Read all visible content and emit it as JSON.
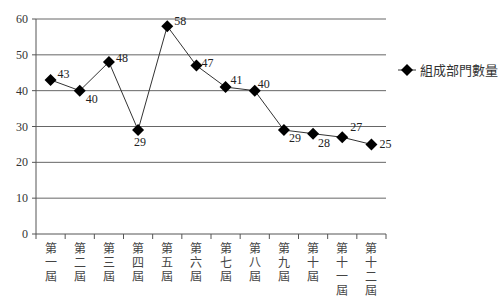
{
  "chart_data": {
    "type": "line",
    "title": "",
    "xlabel": "",
    "ylabel": "",
    "categories": [
      "第一屆",
      "第二屆",
      "第三屆",
      "第四屆",
      "第五屆",
      "第六屆",
      "第七屆",
      "第八屆",
      "第九屆",
      "第十屆",
      "第十一屆",
      "第十二屆"
    ],
    "series": [
      {
        "name": "組成部門數量",
        "values": [
          43,
          40,
          48,
          29,
          58,
          47,
          41,
          40,
          29,
          28,
          27,
          25
        ],
        "marker": "diamond",
        "color": "#000000"
      }
    ],
    "ylim": [
      0,
      60
    ],
    "yticks": [
      0,
      10,
      20,
      30,
      40,
      50,
      60
    ],
    "grid": true,
    "legend_position": "right",
    "data_labels": true
  },
  "legend": {
    "label": "組成部門數量"
  }
}
